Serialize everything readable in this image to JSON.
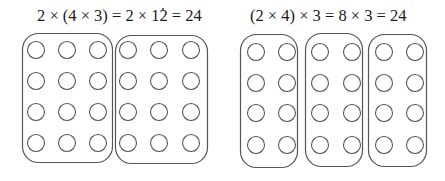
{
  "left_panel": {
    "equation": "2 × (4 × 3) = 2 × 12 = 24",
    "groups": 2,
    "rows_per_group": 4,
    "cols_per_group": 3,
    "total": 24,
    "boxes": [
      {
        "x": 22,
        "y": 33,
        "w": 90,
        "h": 129,
        "r": 16
      },
      {
        "x": 115,
        "y": 35,
        "w": 92,
        "h": 128,
        "r": 16
      }
    ],
    "circle_cols": [
      [
        36,
        67,
        98
      ],
      [
        128,
        159,
        191
      ]
    ],
    "circle_rows": [
      50,
      81,
      112,
      143
    ]
  },
  "right_panel": {
    "equation": "(2 × 4) × 3 = 8 × 3 = 24",
    "groups": 3,
    "rows_per_group": 4,
    "cols_per_group": 2,
    "total": 24,
    "boxes": [
      {
        "x": 240,
        "y": 34,
        "w": 57,
        "h": 133,
        "r": 16
      },
      {
        "x": 305,
        "y": 33,
        "w": 57,
        "h": 133,
        "r": 16
      },
      {
        "x": 368,
        "y": 34,
        "w": 58,
        "h": 132,
        "r": 16
      }
    ],
    "circle_cols": [
      [
        256,
        287
      ],
      [
        320,
        352
      ],
      [
        384,
        415
      ]
    ],
    "circle_rows": [
      52,
      83,
      113,
      145
    ]
  },
  "style": {
    "stroke_color": "#555555",
    "circle_radius": 8.5,
    "background": "#ffffff"
  }
}
